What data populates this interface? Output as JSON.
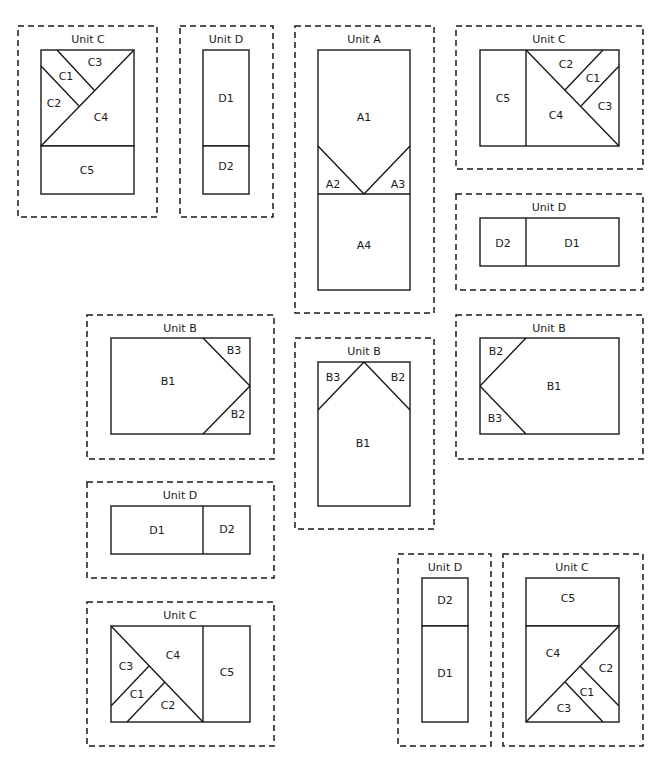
{
  "diagram": {
    "colors": {
      "stroke": "#1a1a1a",
      "background": "#ffffff"
    },
    "units": [
      {
        "id": "unit-c-top-left",
        "title": "Unit C",
        "frame": [
          18,
          26,
          139,
          191
        ],
        "title_pos": [
          88,
          39
        ],
        "rects": [
          [
            41,
            50,
            93,
            96
          ],
          [
            41,
            146,
            93,
            48
          ]
        ],
        "lines": [
          [
            41,
            146,
            134,
            50
          ],
          [
            57,
            50,
            95,
            91
          ],
          [
            41,
            66,
            79,
            106
          ]
        ],
        "labels": [
          {
            "text": "C3",
            "x": 95,
            "y": 62
          },
          {
            "text": "C1",
            "x": 66,
            "y": 76
          },
          {
            "text": "C2",
            "x": 54,
            "y": 103
          },
          {
            "text": "C4",
            "x": 101,
            "y": 117
          },
          {
            "text": "C5",
            "x": 87,
            "y": 170
          }
        ]
      },
      {
        "id": "unit-d-top",
        "title": "Unit D",
        "frame": [
          180,
          26,
          93,
          191
        ],
        "title_pos": [
          226,
          39
        ],
        "rects": [
          [
            203,
            50,
            46,
            96
          ],
          [
            203,
            146,
            46,
            48
          ]
        ],
        "lines": [],
        "labels": [
          {
            "text": "D1",
            "x": 226,
            "y": 98
          },
          {
            "text": "D2",
            "x": 226,
            "y": 166
          }
        ]
      },
      {
        "id": "unit-a",
        "title": "Unit A",
        "frame": [
          295,
          26,
          139,
          287
        ],
        "title_pos": [
          364,
          39
        ],
        "rects": [
          [
            318,
            50,
            92,
            240
          ]
        ],
        "lines": [
          [
            318,
            194,
            410,
            194
          ],
          [
            318,
            146,
            364,
            194
          ],
          [
            410,
            146,
            364,
            194
          ]
        ],
        "labels": [
          {
            "text": "A1",
            "x": 364,
            "y": 117
          },
          {
            "text": "A2",
            "x": 333,
            "y": 184
          },
          {
            "text": "A3",
            "x": 398,
            "y": 184
          },
          {
            "text": "A4",
            "x": 364,
            "y": 245
          }
        ]
      },
      {
        "id": "unit-c-top-right",
        "title": "Unit C",
        "frame": [
          456,
          26,
          187,
          143
        ],
        "title_pos": [
          549,
          39
        ],
        "rects": [
          [
            480,
            50,
            139,
            96
          ]
        ],
        "lines": [
          [
            526,
            50,
            526,
            146
          ],
          [
            526,
            50,
            619,
            146
          ],
          [
            603,
            50,
            565,
            90
          ],
          [
            619,
            66,
            581,
            106
          ]
        ],
        "labels": [
          {
            "text": "C5",
            "x": 503,
            "y": 98
          },
          {
            "text": "C2",
            "x": 566,
            "y": 64
          },
          {
            "text": "C1",
            "x": 593,
            "y": 78
          },
          {
            "text": "C3",
            "x": 605,
            "y": 106
          },
          {
            "text": "C4",
            "x": 556,
            "y": 115
          }
        ]
      },
      {
        "id": "unit-d-right",
        "title": "Unit D",
        "frame": [
          456,
          194,
          187,
          96
        ],
        "title_pos": [
          549,
          207
        ],
        "rects": [
          [
            480,
            218,
            139,
            48
          ]
        ],
        "lines": [
          [
            526,
            218,
            526,
            266
          ]
        ],
        "labels": [
          {
            "text": "D2",
            "x": 503,
            "y": 243
          },
          {
            "text": "D1",
            "x": 572,
            "y": 243
          }
        ]
      },
      {
        "id": "unit-b-left",
        "title": "Unit B",
        "frame": [
          87,
          315,
          187,
          144
        ],
        "title_pos": [
          180,
          328
        ],
        "rects": [
          [
            111,
            338,
            139,
            96
          ]
        ],
        "lines": [
          [
            203,
            338,
            250,
            386
          ],
          [
            250,
            386,
            203,
            434
          ]
        ],
        "labels": [
          {
            "text": "B1",
            "x": 168,
            "y": 381
          },
          {
            "text": "B3",
            "x": 234,
            "y": 350
          },
          {
            "text": "B2",
            "x": 238,
            "y": 414
          }
        ]
      },
      {
        "id": "unit-b-center",
        "title": "Unit B",
        "frame": [
          295,
          338,
          139,
          191
        ],
        "title_pos": [
          364,
          351
        ],
        "rects": [
          [
            318,
            362,
            92,
            144
          ]
        ],
        "lines": [
          [
            318,
            410,
            364,
            362
          ],
          [
            364,
            362,
            410,
            410
          ]
        ],
        "labels": [
          {
            "text": "B3",
            "x": 333,
            "y": 377
          },
          {
            "text": "B2",
            "x": 398,
            "y": 377
          },
          {
            "text": "B1",
            "x": 363,
            "y": 443
          }
        ]
      },
      {
        "id": "unit-b-right",
        "title": "Unit B",
        "frame": [
          456,
          315,
          187,
          144
        ],
        "title_pos": [
          549,
          328
        ],
        "rects": [
          [
            480,
            338,
            139,
            96
          ]
        ],
        "lines": [
          [
            526,
            338,
            480,
            386
          ],
          [
            480,
            386,
            526,
            434
          ]
        ],
        "labels": [
          {
            "text": "B2",
            "x": 496,
            "y": 351
          },
          {
            "text": "B1",
            "x": 554,
            "y": 386
          },
          {
            "text": "B3",
            "x": 495,
            "y": 418
          }
        ]
      },
      {
        "id": "unit-d-left",
        "title": "Unit D",
        "frame": [
          87,
          482,
          187,
          96
        ],
        "title_pos": [
          180,
          495
        ],
        "rects": [
          [
            111,
            506,
            139,
            48
          ]
        ],
        "lines": [
          [
            203,
            506,
            203,
            554
          ]
        ],
        "labels": [
          {
            "text": "D1",
            "x": 157,
            "y": 530
          },
          {
            "text": "D2",
            "x": 227,
            "y": 529
          }
        ]
      },
      {
        "id": "unit-c-bottom-left",
        "title": "Unit C",
        "frame": [
          87,
          602,
          187,
          144
        ],
        "title_pos": [
          180,
          615
        ],
        "rects": [
          [
            111,
            626,
            139,
            96
          ]
        ],
        "lines": [
          [
            203,
            626,
            203,
            722
          ],
          [
            111,
            626,
            203,
            722
          ],
          [
            111,
            706,
            149,
            666
          ],
          [
            127,
            722,
            165,
            682
          ]
        ],
        "labels": [
          {
            "text": "C4",
            "x": 173,
            "y": 655
          },
          {
            "text": "C5",
            "x": 227,
            "y": 672
          },
          {
            "text": "C3",
            "x": 126,
            "y": 666
          },
          {
            "text": "C1",
            "x": 137,
            "y": 694
          },
          {
            "text": "C2",
            "x": 168,
            "y": 705
          }
        ]
      },
      {
        "id": "unit-d-bottom",
        "title": "Unit D",
        "frame": [
          398,
          554,
          93,
          192
        ],
        "title_pos": [
          445,
          567
        ],
        "rects": [
          [
            422,
            578,
            46,
            48
          ],
          [
            422,
            626,
            46,
            96
          ]
        ],
        "lines": [],
        "labels": [
          {
            "text": "D2",
            "x": 445,
            "y": 600
          },
          {
            "text": "D1",
            "x": 445,
            "y": 673
          }
        ]
      },
      {
        "id": "unit-c-bottom-right",
        "title": "Unit C",
        "frame": [
          503,
          554,
          140,
          192
        ],
        "title_pos": [
          572,
          567
        ],
        "rects": [
          [
            526,
            578,
            93,
            48
          ],
          [
            526,
            626,
            93,
            96
          ]
        ],
        "lines": [
          [
            526,
            722,
            619,
            626
          ],
          [
            580,
            666,
            619,
            706
          ],
          [
            565,
            682,
            603,
            722
          ]
        ],
        "labels": [
          {
            "text": "C5",
            "x": 568,
            "y": 598
          },
          {
            "text": "C4",
            "x": 553,
            "y": 653
          },
          {
            "text": "C2",
            "x": 606,
            "y": 668
          },
          {
            "text": "C1",
            "x": 587,
            "y": 692
          },
          {
            "text": "C3",
            "x": 564,
            "y": 708
          }
        ]
      }
    ]
  }
}
